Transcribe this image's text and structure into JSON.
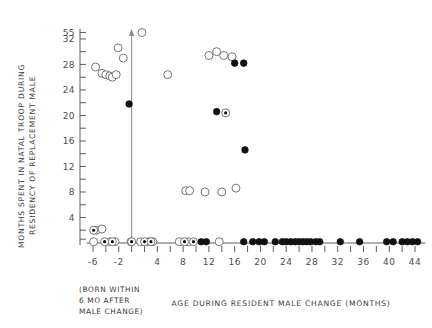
{
  "chart_data": {
    "type": "scatter",
    "title": "",
    "xlabel": "AGE DURING RESIDENT MALE CHANGE (MONTHS)",
    "ylabel_line1": "MONTHS SPENT IN NATAL TROOP DURING",
    "ylabel_line2": "RESIDENCY OF REPLACEMENT MALE",
    "xlim": [
      -7,
      46
    ],
    "ylim": [
      0,
      34
    ],
    "y_break_label": "55",
    "y_break_value": 33,
    "grid": false,
    "legend": "none",
    "x_ticks_minor": [
      -6,
      -4,
      -2,
      0,
      2,
      4,
      6,
      8,
      10,
      12,
      14,
      16,
      18,
      20,
      22,
      24,
      26,
      28,
      30,
      32,
      34,
      36,
      38,
      40,
      42,
      44
    ],
    "x_tick_labels": [
      {
        "value": -6,
        "label": "-6"
      },
      {
        "value": -2,
        "label": "-2"
      },
      {
        "value": 4,
        "label": "4"
      },
      {
        "value": 8,
        "label": "8"
      },
      {
        "value": 12,
        "label": "12"
      },
      {
        "value": 16,
        "label": "16"
      },
      {
        "value": 20,
        "label": "20"
      },
      {
        "value": 24,
        "label": "24"
      },
      {
        "value": 28,
        "label": "28"
      },
      {
        "value": 32,
        "label": "32"
      },
      {
        "value": 36,
        "label": "36"
      },
      {
        "value": 40,
        "label": "40"
      },
      {
        "value": 44,
        "label": "44"
      }
    ],
    "y_ticks_minor": [
      2,
      4,
      6,
      8,
      10,
      12,
      14,
      16,
      18,
      20,
      22,
      24,
      26,
      28,
      30,
      32,
      33
    ],
    "y_tick_labels": [
      {
        "value": 4,
        "label": "4"
      },
      {
        "value": 8,
        "label": "8"
      },
      {
        "value": 12,
        "label": "12"
      },
      {
        "value": 16,
        "label": "16"
      },
      {
        "value": 20,
        "label": "20"
      },
      {
        "value": 24,
        "label": "24"
      },
      {
        "value": 28,
        "label": "28"
      },
      {
        "value": 32,
        "label": "32"
      },
      {
        "value": 33,
        "label": "55"
      }
    ],
    "annotation_line": {
      "x": 0,
      "y_from": 0,
      "y_to": 33.4,
      "arrow": "up",
      "caption": "(BORN WITHIN 6 MO AFTER MALE CHANGE)"
    },
    "note_lines": [
      "(BORN WITHIN",
      " 6 MO AFTER",
      " MALE CHANGE)"
    ],
    "series": [
      {
        "name": "open-circle",
        "marker": "open",
        "points": [
          [
            -5.6,
            27.6
          ],
          [
            -4.6,
            26.6
          ],
          [
            -4.0,
            26.4
          ],
          [
            -3.4,
            26.2
          ],
          [
            -3.0,
            26.0
          ],
          [
            -2.4,
            26.4
          ],
          [
            -2.1,
            30.6
          ],
          [
            -1.3,
            29.0
          ],
          [
            1.6,
            33.0
          ],
          [
            5.6,
            26.4
          ],
          [
            12.0,
            29.4
          ],
          [
            13.2,
            30.0
          ],
          [
            14.3,
            29.4
          ],
          [
            15.6,
            29.2
          ],
          [
            8.4,
            8.2
          ],
          [
            9.0,
            8.2
          ],
          [
            11.4,
            8.0
          ],
          [
            14.0,
            8.0
          ],
          [
            16.2,
            8.6
          ],
          [
            -5.5,
            2.0
          ],
          [
            -4.6,
            2.2
          ],
          [
            -5.9,
            0.2
          ],
          [
            -3.4,
            0.2
          ],
          [
            -2.6,
            0.2
          ],
          [
            -0.1,
            0.2
          ],
          [
            1.4,
            0.2
          ],
          [
            2.6,
            0.2
          ],
          [
            3.3,
            0.2
          ],
          [
            7.4,
            0.2
          ],
          [
            8.8,
            0.2
          ],
          [
            13.6,
            0.2
          ]
        ]
      },
      {
        "name": "filled-circle",
        "marker": "filled",
        "points": [
          [
            -0.4,
            21.8
          ],
          [
            16.0,
            28.2
          ],
          [
            17.4,
            28.2
          ],
          [
            13.2,
            20.6
          ],
          [
            17.6,
            14.6
          ],
          [
            17.4,
            0.2
          ],
          [
            18.8,
            0.2
          ],
          [
            19.8,
            0.2
          ],
          [
            20.6,
            0.2
          ],
          [
            22.3,
            0.2
          ],
          [
            23.4,
            0.2
          ],
          [
            24.0,
            0.2
          ],
          [
            24.7,
            0.2
          ],
          [
            25.4,
            0.2
          ],
          [
            26.0,
            0.2
          ],
          [
            26.6,
            0.2
          ],
          [
            27.2,
            0.2
          ],
          [
            27.8,
            0.2
          ],
          [
            28.6,
            0.2
          ],
          [
            29.2,
            0.2
          ],
          [
            32.4,
            0.2
          ],
          [
            35.4,
            0.2
          ],
          [
            39.6,
            0.2
          ],
          [
            40.6,
            0.2
          ],
          [
            42.0,
            0.2
          ],
          [
            42.8,
            0.2
          ],
          [
            43.6,
            0.2
          ],
          [
            44.4,
            0.2
          ],
          [
            10.8,
            0.2
          ],
          [
            11.6,
            0.2
          ]
        ]
      },
      {
        "name": "dotted-circle",
        "marker": "dotted",
        "points": [
          [
            14.6,
            20.4
          ],
          [
            -5.9,
            2.0
          ],
          [
            -4.2,
            0.2
          ],
          [
            -3.0,
            0.2
          ],
          [
            0.0,
            0.2
          ],
          [
            2.0,
            0.2
          ],
          [
            3.0,
            0.2
          ],
          [
            8.2,
            0.2
          ],
          [
            9.6,
            0.2
          ]
        ]
      }
    ]
  }
}
